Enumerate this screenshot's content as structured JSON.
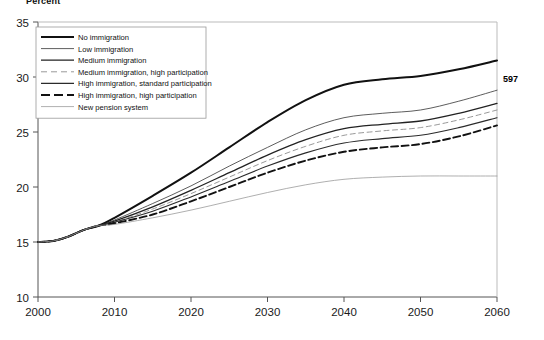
{
  "figure": {
    "axis_title": "Percent",
    "page_number": "597"
  },
  "chart_data": {
    "type": "line",
    "title": "",
    "subtitle": "",
    "xlabel": "",
    "ylabel": "Percent",
    "xlim": [
      2000,
      2060
    ],
    "ylim": [
      10,
      35
    ],
    "xticks": [
      2000,
      2010,
      2020,
      2030,
      2040,
      2050,
      2060
    ],
    "yticks": [
      10,
      15,
      20,
      25,
      30,
      35
    ],
    "xtick_labels": [
      "2000",
      "2010",
      "2020",
      "2030",
      "2040",
      "2050",
      "2060"
    ],
    "ytick_labels": [
      "10",
      "15",
      "20",
      "25",
      "30",
      "35"
    ],
    "grid": false,
    "legend_position": "upper left",
    "x": [
      2000,
      2002,
      2004,
      2006,
      2008,
      2010,
      2015,
      2020,
      2025,
      2030,
      2035,
      2040,
      2045,
      2050,
      2055,
      2060
    ],
    "series": [
      {
        "name": "No immigration",
        "style": "solid",
        "width": 2.0,
        "color": "#111111",
        "values": [
          15.0,
          15.1,
          15.5,
          16.1,
          16.5,
          17.2,
          19.2,
          21.3,
          23.6,
          25.9,
          27.9,
          29.3,
          29.8,
          30.1,
          30.7,
          31.5
        ]
      },
      {
        "name": "Low immigration",
        "style": "solid",
        "width": 0.8,
        "color": "#333333",
        "values": [
          15.0,
          15.1,
          15.5,
          16.1,
          16.5,
          17.0,
          18.5,
          20.1,
          21.9,
          23.6,
          25.2,
          26.3,
          26.7,
          27.0,
          27.8,
          28.8
        ]
      },
      {
        "name": "Medium immigration",
        "style": "solid",
        "width": 1.3,
        "color": "#222222",
        "values": [
          15.0,
          15.1,
          15.5,
          16.1,
          16.5,
          16.9,
          18.2,
          19.7,
          21.3,
          22.9,
          24.3,
          25.3,
          25.7,
          26.0,
          26.7,
          27.6
        ]
      },
      {
        "name": "Medium immigration, high participation",
        "style": "dashed",
        "width": 0.9,
        "color": "#8d8d8d",
        "values": [
          15.0,
          15.1,
          15.5,
          16.1,
          16.5,
          16.8,
          18.0,
          19.4,
          20.9,
          22.4,
          23.7,
          24.7,
          25.1,
          25.4,
          26.1,
          27.0
        ]
      },
      {
        "name": "High immigration, standard participation",
        "style": "solid",
        "width": 1.1,
        "color": "#2b2b2b",
        "values": [
          15.0,
          15.1,
          15.5,
          16.1,
          16.5,
          16.8,
          17.8,
          19.1,
          20.5,
          21.9,
          23.1,
          24.0,
          24.4,
          24.7,
          25.4,
          26.3
        ]
      },
      {
        "name": "High immigration, high participation",
        "style": "dashed",
        "width": 1.9,
        "color": "#111111",
        "values": [
          15.0,
          15.1,
          15.5,
          16.1,
          16.5,
          16.7,
          17.5,
          18.7,
          20.0,
          21.3,
          22.4,
          23.2,
          23.6,
          23.9,
          24.6,
          25.6
        ]
      },
      {
        "name": "New pension system",
        "style": "solid",
        "width": 0.8,
        "color": "#9a9a9a",
        "values": [
          15.0,
          15.1,
          15.5,
          16.1,
          16.5,
          16.6,
          17.2,
          17.9,
          18.7,
          19.5,
          20.2,
          20.7,
          20.9,
          21.0,
          21.0,
          21.0
        ]
      }
    ]
  }
}
